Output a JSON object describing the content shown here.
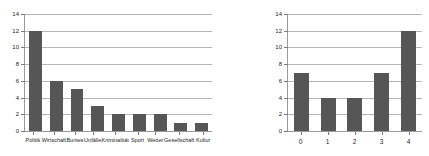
{
  "chart_data": [
    {
      "type": "bar",
      "title": "",
      "xlabel": "",
      "ylabel": "",
      "categories": [
        "Politik",
        "Wirtschaft",
        "Buntes",
        "Unfälle",
        "Kriminalität",
        "Sport",
        "Wetter",
        "Gesellschaft",
        "Kultur"
      ],
      "values": [
        12,
        6,
        5,
        3,
        2,
        2,
        2,
        1,
        1
      ],
      "ylim": [
        0,
        14
      ],
      "yticks": [
        0,
        2,
        4,
        6,
        8,
        10,
        12,
        14
      ],
      "ytick_labels": [
        "0",
        "2",
        "4",
        "6",
        "8",
        "10",
        "12",
        "14"
      ],
      "grid": true,
      "legend": false,
      "bar_color": "#565656",
      "gridline_color": "#b5b5b5",
      "axis_color": "#9a9a9a"
    },
    {
      "type": "bar",
      "title": "",
      "xlabel": "",
      "ylabel": "",
      "categories": [
        "0",
        "1",
        "2",
        "3",
        "4"
      ],
      "values": [
        7,
        4,
        4,
        7,
        12
      ],
      "ylim": [
        0,
        14
      ],
      "yticks": [
        0,
        2,
        4,
        6,
        8,
        10,
        12,
        14
      ],
      "ytick_labels": [
        "0",
        "2",
        "4",
        "6",
        "8",
        "10",
        "12",
        "14"
      ],
      "grid": true,
      "legend": false,
      "bar_color": "#565656",
      "gridline_color": "#b5b5b5",
      "axis_color": "#9a9a9a"
    }
  ]
}
